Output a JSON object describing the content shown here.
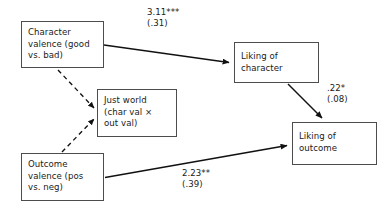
{
  "diagram": {
    "nodes": {
      "character_valence": "Character\nvalence (good\nvs. bad)",
      "just_world": "Just world\n(char val ×\nout val)",
      "outcome_valence": "Outcome\nvalence (pos\nvs. neg)",
      "liking_character": "Liking of\ncharacter",
      "liking_outcome": "Liking of\noutcome"
    },
    "edge_labels": {
      "char_to_liking_char": "3.11***\n(.31)",
      "liking_char_to_liking_out": ".22*\n(.08)",
      "outcome_to_liking_out": "2.23**\n(.39)"
    },
    "colors": {
      "stroke": "#4d4d4d",
      "arrow": "#111111",
      "text": "#1a1a1a",
      "background": "#ffffff"
    }
  }
}
